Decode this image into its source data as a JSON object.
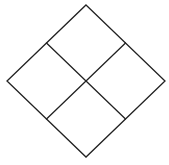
{
  "diagram": {
    "type": "diamond-grid",
    "stroke_color": "#222222",
    "background": "#ffffff",
    "vertices": {
      "top": [
        86,
        5
      ],
      "right": [
        165,
        81
      ],
      "bottom": [
        86,
        157
      ],
      "left": [
        7,
        81
      ],
      "center": [
        86,
        81
      ]
    },
    "quadrants": [
      {
        "id": "top",
        "label": ""
      },
      {
        "id": "left",
        "label": ""
      },
      {
        "id": "right",
        "label": ""
      },
      {
        "id": "bottom",
        "label": ""
      }
    ]
  }
}
